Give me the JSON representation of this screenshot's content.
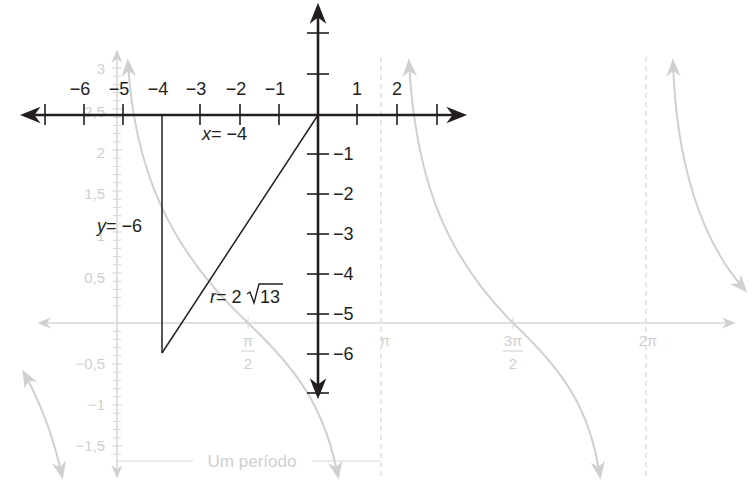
{
  "figure": {
    "colors": {
      "foreground": "#231f20",
      "background_graph": "#d0d0d0",
      "background": "#ffffff"
    },
    "coordinate_plane": {
      "x_tick_labels": [
        "−6",
        "−5",
        "−4",
        "−3",
        "−2",
        "−1",
        "1",
        "2"
      ],
      "y_tick_labels": [
        "−1",
        "−2",
        "−3",
        "−4",
        "−5",
        "−6"
      ],
      "triangle": {
        "x_label_var": "x",
        "x_label_eq": "= −4",
        "y_label_var": "y",
        "y_label_eq": "= −6",
        "r_label_var": "r",
        "r_label_eq": "= 2",
        "r_label_root": "13"
      }
    },
    "cotangent_graph": {
      "y_tick_labels": [
        "3",
        "2,5",
        "2",
        "1,5",
        "1",
        "0,5",
        "−0,5",
        "−1",
        "−1,5"
      ],
      "x_tick_labels": {
        "half_pi_num": "π",
        "half_pi_den": "2",
        "pi": "π",
        "three_half_pi_num": "3π",
        "three_half_pi_den": "2",
        "two_pi": "2π"
      },
      "period_label": "Um período"
    }
  }
}
